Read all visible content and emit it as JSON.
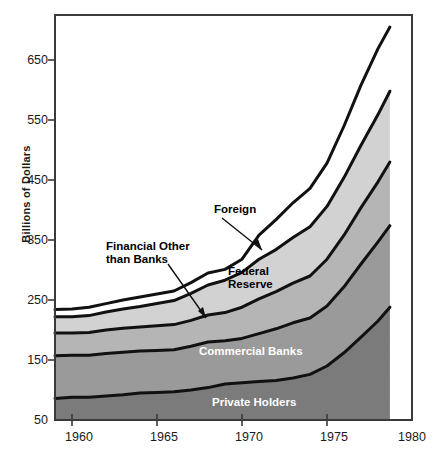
{
  "chart_data": {
    "type": "area",
    "title": "",
    "subtitle": "",
    "xlabel": "",
    "ylabel": "Billions of Dollars",
    "stacked": true,
    "grid": false,
    "legend_position": "inline-annotations",
    "xlim": [
      1959,
      1980
    ],
    "ylim": [
      50,
      720
    ],
    "xticks": [
      1960,
      1965,
      1970,
      1975,
      1980
    ],
    "yticks": [
      50,
      150,
      250,
      350,
      450,
      550,
      650
    ],
    "x": [
      1959,
      1960,
      1961,
      1962,
      1963,
      1964,
      1965,
      1966,
      1967,
      1968,
      1969,
      1970,
      1971,
      1972,
      1973,
      1974,
      1975,
      1976,
      1977,
      1978,
      1978.7
    ],
    "series": [
      {
        "name": "Private Holders",
        "color": "#7b7b7b",
        "values": [
          86,
          88,
          88,
          90,
          92,
          95,
          96,
          97,
          100,
          104,
          110,
          112,
          114,
          116,
          120,
          126,
          140,
          162,
          188,
          215,
          238
        ]
      },
      {
        "name": "Commercial Banks",
        "color": "#9a9a9a",
        "values": [
          71,
          70,
          70,
          71,
          71,
          70,
          70,
          70,
          73,
          76,
          72,
          74,
          80,
          86,
          92,
          94,
          100,
          110,
          122,
          132,
          136
        ]
      },
      {
        "name": "Financial Other than Banks",
        "color": "#b5b5b5",
        "values": [
          38,
          37,
          38,
          39,
          40,
          40,
          41,
          42,
          43,
          45,
          47,
          52,
          58,
          62,
          66,
          70,
          78,
          86,
          94,
          100,
          106
        ]
      },
      {
        "name": "Federal Reserve",
        "color": "#d2d2d2",
        "values": [
          27,
          27,
          28,
          30,
          32,
          34,
          37,
          40,
          45,
          50,
          54,
          58,
          66,
          70,
          76,
          82,
          88,
          96,
          104,
          112,
          118
        ]
      },
      {
        "name": "Foreign",
        "color": "#ffffff",
        "values": [
          12,
          13,
          14,
          14,
          15,
          16,
          16,
          16,
          18,
          20,
          18,
          22,
          40,
          50,
          58,
          64,
          72,
          86,
          100,
          110,
          107
        ]
      }
    ],
    "annotations": [
      {
        "text": "Foreign",
        "style": "dark"
      },
      {
        "text": "Financial Other\nthan Banks",
        "style": "dark"
      },
      {
        "text": "Federal\nReserve",
        "style": "dark"
      },
      {
        "text": "Commercial Banks",
        "style": "light"
      },
      {
        "text": "Private Holders",
        "style": "light"
      }
    ]
  },
  "axis": {
    "y_title": "Billions of Dollars",
    "y_ticks": [
      "650",
      "550",
      "450",
      "350",
      "250",
      "150",
      "50"
    ],
    "x_ticks": [
      "1960",
      "1965",
      "1970",
      "1975",
      "1980"
    ]
  },
  "labels": {
    "foreign": "Foreign",
    "financial_other_l1": "Financial Other",
    "financial_other_l2": "than Banks",
    "federal_reserve_l1": "Federal",
    "federal_reserve_l2": "Reserve",
    "commercial_banks": "Commercial Banks",
    "private_holders": "Private Holders"
  }
}
